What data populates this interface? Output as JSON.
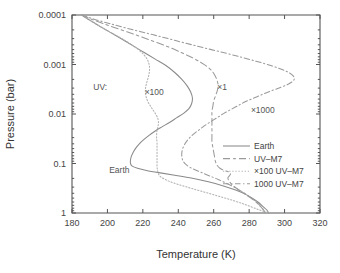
{
  "chart_data": {
    "type": "line",
    "title": "",
    "xlabel": "Temperature (K)",
    "ylabel": "Pressure (bar)",
    "xlim": [
      180,
      320
    ],
    "ylim": [
      0.0001,
      1
    ],
    "yscale": "log",
    "y_inverted": true,
    "grid": false,
    "xticks": [
      "180",
      "200",
      "220",
      "240",
      "260",
      "280",
      "300",
      "320"
    ],
    "xtick_values": [
      180,
      200,
      220,
      240,
      260,
      280,
      300,
      320
    ],
    "yticks": [
      "0.0001",
      "0.001",
      "0.01",
      "0.1",
      "1"
    ],
    "ytick_values": [
      0.0001,
      0.001,
      0.01,
      0.1,
      1
    ],
    "legend_position": "lower right",
    "annotations": [
      {
        "text": "UV:",
        "x": 192,
        "y": 0.0032
      },
      {
        "text": "×100",
        "x": 221,
        "y": 0.0042
      },
      {
        "text": "×1",
        "x": 262,
        "y": 0.0032
      },
      {
        "text": "×1000",
        "x": 281,
        "y": 0.0095
      },
      {
        "text": "Earth",
        "x": 201,
        "y": 0.155
      }
    ],
    "series": [
      {
        "name": "Earth",
        "style": "solid",
        "color": "#8a8a8a",
        "points": [
          [
            185.5,
            0.0001
          ],
          [
            188,
            0.000115
          ],
          [
            192,
            0.00014
          ],
          [
            197,
            0.00018
          ],
          [
            203,
            0.00024
          ],
          [
            209,
            0.00032
          ],
          [
            215,
            0.00043
          ],
          [
            221,
            0.00058
          ],
          [
            227,
            0.00078
          ],
          [
            233,
            0.00105
          ],
          [
            238,
            0.00145
          ],
          [
            242,
            0.002
          ],
          [
            245,
            0.0027
          ],
          [
            247,
            0.0036
          ],
          [
            248,
            0.0048
          ],
          [
            247.5,
            0.0062
          ],
          [
            246,
            0.0078
          ],
          [
            243,
            0.0097
          ],
          [
            239,
            0.012
          ],
          [
            235,
            0.0148
          ],
          [
            231,
            0.018
          ],
          [
            227,
            0.022
          ],
          [
            223.5,
            0.027
          ],
          [
            220.5,
            0.033
          ],
          [
            218,
            0.04
          ],
          [
            216,
            0.049
          ],
          [
            214.5,
            0.06
          ],
          [
            213.5,
            0.072
          ],
          [
            213,
            0.086
          ],
          [
            213,
            0.1
          ],
          [
            214,
            0.113
          ],
          [
            217,
            0.125
          ],
          [
            222,
            0.138
          ],
          [
            229,
            0.153
          ],
          [
            238,
            0.172
          ],
          [
            248,
            0.198
          ],
          [
            257,
            0.233
          ],
          [
            265,
            0.28
          ],
          [
            272,
            0.34
          ],
          [
            278,
            0.42
          ],
          [
            282,
            0.51
          ],
          [
            285.5,
            0.62
          ],
          [
            288,
            0.75
          ],
          [
            290,
            0.87
          ],
          [
            291,
            1.0
          ]
        ]
      },
      {
        "name": "UV–M7",
        "style": "dashed",
        "color": "#9a9a9a",
        "points": [
          [
            185.5,
            0.0001
          ],
          [
            190,
            0.000118
          ],
          [
            196,
            0.000142
          ],
          [
            203,
            0.000175
          ],
          [
            211,
            0.000218
          ],
          [
            219,
            0.000275
          ],
          [
            227,
            0.00035
          ],
          [
            235,
            0.00045
          ],
          [
            242,
            0.00058
          ],
          [
            248,
            0.00073
          ],
          [
            253,
            0.00092
          ],
          [
            257,
            0.00115
          ],
          [
            259.5,
            0.00142
          ],
          [
            261,
            0.00175
          ],
          [
            262,
            0.00215
          ],
          [
            262.5,
            0.0027
          ],
          [
            262,
            0.0034
          ],
          [
            261,
            0.0043
          ],
          [
            260,
            0.0055
          ],
          [
            259.5,
            0.007
          ],
          [
            259,
            0.0088
          ],
          [
            259,
            0.011
          ],
          [
            259,
            0.014
          ],
          [
            259,
            0.018
          ],
          [
            259,
            0.023
          ],
          [
            259,
            0.029
          ],
          [
            259,
            0.037
          ],
          [
            259.5,
            0.047
          ],
          [
            260,
            0.059
          ],
          [
            260.5,
            0.074
          ],
          [
            261,
            0.092
          ],
          [
            262,
            0.11
          ],
          [
            263.5,
            0.125
          ],
          [
            266,
            0.138
          ],
          [
            268.5,
            0.148
          ],
          [
            269.5,
            0.16
          ],
          [
            269,
            0.175
          ],
          [
            268,
            0.195
          ],
          [
            268.5,
            0.22
          ],
          [
            270,
            0.26
          ],
          [
            273,
            0.32
          ],
          [
            277,
            0.4
          ],
          [
            281,
            0.5
          ],
          [
            284.5,
            0.63
          ],
          [
            287,
            0.78
          ],
          [
            288.5,
            0.9
          ],
          [
            289,
            1.0
          ]
        ]
      },
      {
        "name": "×100 UV–M7",
        "style": "dotted",
        "color": "#b0b0b0",
        "points": [
          [
            185.5,
            0.0001
          ],
          [
            187.5,
            0.000112
          ],
          [
            190.5,
            0.000132
          ],
          [
            194.5,
            0.00016
          ],
          [
            199,
            0.000198
          ],
          [
            204,
            0.000248
          ],
          [
            209,
            0.000312
          ],
          [
            213.5,
            0.000395
          ],
          [
            217.5,
            0.0005
          ],
          [
            220.5,
            0.00063
          ],
          [
            222.5,
            0.00079
          ],
          [
            223.5,
            0.00099
          ],
          [
            223.8,
            0.00124
          ],
          [
            223.5,
            0.00155
          ],
          [
            222.8,
            0.00195
          ],
          [
            222,
            0.00245
          ],
          [
            221.5,
            0.00305
          ],
          [
            221.5,
            0.0038
          ],
          [
            222,
            0.0047
          ],
          [
            223,
            0.0058
          ],
          [
            224.5,
            0.0071
          ],
          [
            226,
            0.0086
          ],
          [
            227.5,
            0.0104
          ],
          [
            228.5,
            0.0125
          ],
          [
            228.8,
            0.015
          ],
          [
            228.5,
            0.018
          ],
          [
            228,
            0.0215
          ],
          [
            227.8,
            0.0258
          ],
          [
            227.8,
            0.031
          ],
          [
            228,
            0.0375
          ],
          [
            228,
            0.045
          ],
          [
            228,
            0.0545
          ],
          [
            228,
            0.066
          ],
          [
            228,
            0.08
          ],
          [
            228,
            0.096
          ],
          [
            228,
            0.115
          ],
          [
            228.2,
            0.133
          ],
          [
            228.5,
            0.15
          ],
          [
            229,
            0.167
          ],
          [
            230,
            0.185
          ],
          [
            232,
            0.205
          ],
          [
            235,
            0.23
          ],
          [
            240,
            0.265
          ],
          [
            247,
            0.315
          ],
          [
            255,
            0.38
          ],
          [
            263,
            0.46
          ],
          [
            271,
            0.56
          ],
          [
            278,
            0.68
          ],
          [
            284,
            0.82
          ],
          [
            288,
            0.92
          ],
          [
            291,
            1.0
          ]
        ]
      },
      {
        "name": "1000 UV–M7",
        "style": "dashdot",
        "color": "#9a9a9a",
        "points": [
          [
            185.5,
            0.0001
          ],
          [
            192,
            0.00012
          ],
          [
            201,
            0.000148
          ],
          [
            211,
            0.000185
          ],
          [
            222,
            0.000232
          ],
          [
            233,
            0.000292
          ],
          [
            244,
            0.00037
          ],
          [
            255,
            0.000465
          ],
          [
            266,
            0.00058
          ],
          [
            276,
            0.00072
          ],
          [
            285,
            0.00088
          ],
          [
            293,
            0.00107
          ],
          [
            299,
            0.00128
          ],
          [
            303,
            0.0015
          ],
          [
            305,
            0.00172
          ],
          [
            305.5,
            0.00195
          ],
          [
            304.5,
            0.0022
          ],
          [
            302,
            0.0025
          ],
          [
            298,
            0.00288
          ],
          [
            293,
            0.00335
          ],
          [
            288,
            0.00395
          ],
          [
            283,
            0.0047
          ],
          [
            278,
            0.0056
          ],
          [
            274,
            0.0067
          ],
          [
            270,
            0.008
          ],
          [
            266,
            0.0096
          ],
          [
            262.5,
            0.0115
          ],
          [
            259,
            0.0138
          ],
          [
            255.5,
            0.0166
          ],
          [
            252.5,
            0.02
          ],
          [
            249.5,
            0.024
          ],
          [
            247,
            0.0288
          ],
          [
            245,
            0.0345
          ],
          [
            243.5,
            0.0415
          ],
          [
            242.5,
            0.05
          ],
          [
            242,
            0.06
          ],
          [
            242,
            0.072
          ],
          [
            242.5,
            0.086
          ],
          [
            244,
            0.102
          ],
          [
            246.5,
            0.119
          ],
          [
            250,
            0.137
          ],
          [
            254,
            0.157
          ],
          [
            258,
            0.18
          ],
          [
            262.5,
            0.21
          ],
          [
            267,
            0.25
          ],
          [
            271.5,
            0.3
          ],
          [
            276,
            0.37
          ],
          [
            280,
            0.46
          ],
          [
            283.5,
            0.57
          ],
          [
            286,
            0.7
          ],
          [
            288,
            0.85
          ],
          [
            289,
            1.0
          ]
        ]
      }
    ]
  },
  "legend": {
    "items": [
      {
        "label": "Earth",
        "style": "solid"
      },
      {
        "label": "UV–M7",
        "style": "dashed"
      },
      {
        "label": "×100 UV–M7",
        "style": "dotted"
      },
      {
        "label": "1000 UV–M7",
        "style": "dashdot"
      }
    ]
  }
}
